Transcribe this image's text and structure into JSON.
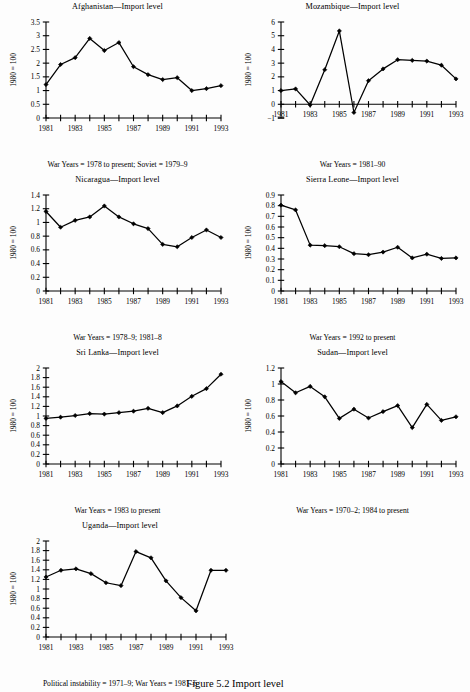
{
  "figure": {
    "caption": "Figure 5.2  Import level",
    "y_axis_label": "1980 = 100"
  },
  "chart_data": [
    {
      "type": "line",
      "title": "Afghanistan—Import level",
      "caption": "War Years = 1978 to present; Soviet = 1979–9",
      "xlabel": "",
      "ylabel": "1980 = 100",
      "x": [
        1981,
        1982,
        1983,
        1984,
        1985,
        1986,
        1987,
        1988,
        1989,
        1990,
        1991,
        1992,
        1993
      ],
      "values": [
        1.22,
        1.95,
        2.2,
        2.9,
        2.46,
        2.75,
        1.87,
        1.58,
        1.4,
        1.47,
        1.0,
        1.07,
        1.18
      ],
      "ylim": [
        0,
        3.5
      ],
      "yticks": [
        0,
        0.5,
        1,
        1.5,
        2,
        2.5,
        3,
        3.5
      ],
      "ytick_labels": [
        "0",
        "0.5",
        "1",
        "1.5",
        "2",
        "2.5",
        "3",
        "3.5"
      ],
      "xtick_labels": [
        "1981",
        "1983",
        "1985",
        "1987",
        "1989",
        "1991",
        "1993"
      ],
      "grid": false,
      "legend": "none"
    },
    {
      "type": "line",
      "title": "Mozambique—Import level",
      "caption": "War Years = 1981–90",
      "xlabel": "",
      "ylabel": "1980 = 100",
      "x": [
        1981,
        1982,
        1983,
        1984,
        1985,
        1986,
        1987,
        1988,
        1989,
        1990,
        1991,
        1992,
        1993
      ],
      "values": [
        1.0,
        1.12,
        -0.05,
        2.52,
        5.35,
        -0.6,
        1.72,
        2.58,
        3.25,
        3.2,
        3.15,
        2.85,
        1.85
      ],
      "ylim": [
        -1,
        6
      ],
      "yticks": [
        -1,
        0,
        1,
        2,
        3,
        4,
        5,
        6
      ],
      "ytick_labels": [
        "−1",
        "0",
        "1",
        "2",
        "3",
        "4",
        "5",
        "6"
      ],
      "xtick_labels": [
        "1981",
        "1983",
        "1985",
        "1987",
        "1989",
        "1991",
        "1993"
      ],
      "grid": false,
      "legend": "none"
    },
    {
      "type": "line",
      "title": "Nicaragua—Import level",
      "caption": "War Years = 1978–9; 1981–8",
      "xlabel": "",
      "ylabel": "1980 = 100",
      "x": [
        1981,
        1982,
        1983,
        1984,
        1985,
        1986,
        1987,
        1988,
        1989,
        1990,
        1991,
        1992,
        1993
      ],
      "values": [
        1.16,
        0.93,
        1.03,
        1.08,
        1.24,
        1.08,
        0.98,
        0.91,
        0.68,
        0.645,
        0.78,
        0.89,
        0.78
      ],
      "ylim": [
        0,
        1.4
      ],
      "yticks": [
        0,
        0.2,
        0.4,
        0.6,
        0.8,
        1,
        1.2,
        1.4
      ],
      "ytick_labels": [
        "0",
        "0.2",
        "0.4",
        "0.6",
        "0.8",
        "1",
        "1.2",
        "1.4"
      ],
      "xtick_labels": [
        "1981",
        "1983",
        "1985",
        "1987",
        "1989",
        "1991",
        "1993"
      ],
      "grid": false,
      "legend": "none"
    },
    {
      "type": "line",
      "title": "Sierra Leone—Import level",
      "caption": "War Years = 1992 to present",
      "xlabel": "",
      "ylabel": "1980 = 100",
      "x": [
        1981,
        1982,
        1983,
        1984,
        1985,
        1986,
        1987,
        1988,
        1989,
        1990,
        1991,
        1992,
        1993
      ],
      "values": [
        0.805,
        0.76,
        0.43,
        0.425,
        0.415,
        0.35,
        0.34,
        0.365,
        0.41,
        0.31,
        0.345,
        0.305,
        0.31
      ],
      "ylim": [
        0,
        0.9
      ],
      "yticks": [
        0,
        0.1,
        0.2,
        0.3,
        0.4,
        0.5,
        0.6,
        0.7,
        0.8,
        0.9
      ],
      "ytick_labels": [
        "0",
        "0.1",
        "0.2",
        "0.3",
        "0.4",
        "0.5",
        "0.6",
        "0.7",
        "0.8",
        "0.9"
      ],
      "xtick_labels": [
        "1981",
        "1983",
        "1985",
        "1987",
        "1989",
        "1991",
        "1993"
      ],
      "grid": false,
      "legend": "none"
    },
    {
      "type": "line",
      "title": "Sri Lanka—Import level",
      "caption": "War Years = 1983 to present",
      "xlabel": "",
      "ylabel": "1980 = 100",
      "x": [
        1981,
        1982,
        1983,
        1984,
        1985,
        1986,
        1987,
        1988,
        1989,
        1990,
        1991,
        1992,
        1993
      ],
      "values": [
        0.95,
        0.975,
        1.01,
        1.05,
        1.04,
        1.07,
        1.1,
        1.16,
        1.07,
        1.21,
        1.41,
        1.57,
        1.87
      ],
      "ylim": [
        0,
        2
      ],
      "yticks": [
        0,
        0.2,
        0.4,
        0.6,
        0.8,
        1,
        1.2,
        1.4,
        1.6,
        1.8,
        2
      ],
      "ytick_labels": [
        "0",
        "0.2",
        "0.4",
        "0.6",
        "0.8",
        "1",
        "1.2",
        "1.4",
        "1.6",
        "1.8",
        "2"
      ],
      "xtick_labels": [
        "1981",
        "1983",
        "1985",
        "1987",
        "1989",
        "1991",
        "1993"
      ],
      "grid": false,
      "legend": "none"
    },
    {
      "type": "line",
      "title": "Sudan—Import level",
      "caption": "War Years = 1970–2; 1984 to present",
      "xlabel": "",
      "ylabel": "1980 = 100",
      "x": [
        1981,
        1982,
        1983,
        1984,
        1985,
        1986,
        1987,
        1988,
        1989,
        1990,
        1991,
        1992,
        1993
      ],
      "values": [
        1.03,
        0.89,
        0.97,
        0.84,
        0.57,
        0.685,
        0.575,
        0.655,
        0.73,
        0.455,
        0.745,
        0.545,
        0.59
      ],
      "ylim": [
        0,
        1.2
      ],
      "yticks": [
        0,
        0.2,
        0.4,
        0.6,
        0.8,
        1,
        1.2
      ],
      "ytick_labels": [
        "0",
        "0.2",
        "0.4",
        "0.6",
        "0.8",
        "1",
        "1.2"
      ],
      "xtick_labels": [
        "1981",
        "1983",
        "1985",
        "1987",
        "1989",
        "1991",
        "1993"
      ],
      "grid": false,
      "legend": "none"
    },
    {
      "type": "line",
      "title": "Uganda—Import level",
      "caption": "Political instability = 1971–9; War Years = 1981–6",
      "xlabel": "",
      "ylabel": "1980 = 100",
      "x": [
        1981,
        1982,
        1983,
        1984,
        1985,
        1986,
        1987,
        1988,
        1989,
        1990,
        1991,
        1992,
        1993
      ],
      "values": [
        1.25,
        1.39,
        1.42,
        1.32,
        1.13,
        1.07,
        1.78,
        1.65,
        1.17,
        0.82,
        0.545,
        1.39,
        1.39
      ],
      "ylim": [
        0,
        2
      ],
      "yticks": [
        0,
        0.2,
        0.4,
        0.6,
        0.8,
        1,
        1.2,
        1.4,
        1.6,
        1.8,
        2
      ],
      "ytick_labels": [
        "0",
        "0.2",
        "0.4",
        "0.6",
        "0.8",
        "1",
        "1.2",
        "1.4",
        "1.6",
        "1.8",
        "2"
      ],
      "xtick_labels": [
        "1981",
        "1983",
        "1985",
        "1987",
        "1989",
        "1991",
        "1993"
      ],
      "grid": false,
      "legend": "none"
    }
  ]
}
